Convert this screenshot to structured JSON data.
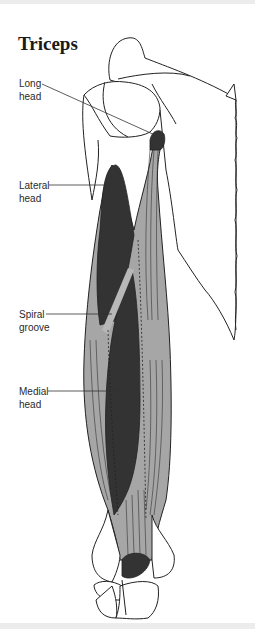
{
  "title": "Triceps",
  "labels": [
    {
      "id": "long-head",
      "line1": "Long",
      "line2": "head"
    },
    {
      "id": "lateral-head",
      "line1": "Lateral",
      "line2": "head"
    },
    {
      "id": "spiral-groove",
      "line1": "Spiral",
      "line2": "groove"
    },
    {
      "id": "medial-head",
      "line1": "Medial",
      "line2": "head"
    }
  ],
  "colors": {
    "muscle_dark": "#333333",
    "muscle_light": "#a6a6a6",
    "bone_outline": "#222222",
    "bone_fill": "#ffffff",
    "leader_line": "#333333"
  }
}
